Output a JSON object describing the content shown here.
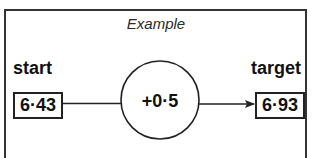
{
  "diagram": {
    "title": "Example",
    "start": {
      "label": "start",
      "value": "6·43"
    },
    "operation": {
      "value": "+0·5",
      "shape": "circle"
    },
    "target": {
      "label": "target",
      "value": "6·93"
    },
    "flow": [
      "start",
      "operation",
      "target"
    ],
    "colors": {
      "stroke": "#222222",
      "text": "#111111",
      "background": "#ffffff"
    }
  }
}
